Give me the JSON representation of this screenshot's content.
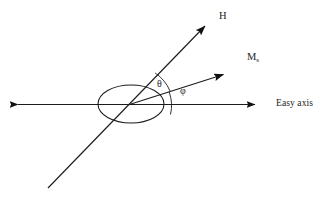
{
  "figure": {
    "background_color": "#ffffff",
    "stroke_color": "#1c1c1c",
    "labels": {
      "field_vector": "H",
      "magnetization_vector": "M",
      "magnetization_subscript": "s",
      "angle_theta": "θ",
      "angle_phi": "φ",
      "axis": "Easy axis"
    },
    "caption": "",
    "geometry": {
      "origin_x": 131,
      "origin_y": 104,
      "easy_axis_left_x": 10,
      "easy_axis_right_x": 262,
      "ellipse_rx": 33,
      "ellipse_ry": 19,
      "h_tip_x": 212,
      "h_tip_y": 18,
      "h_tail_x": 48,
      "h_tail_y": 188,
      "ms_tip_x": 230,
      "ms_tip_y": 70,
      "theta_degrees": 26,
      "phi_degrees": 14
    }
  }
}
